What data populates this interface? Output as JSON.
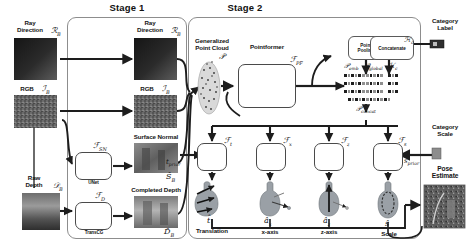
{
  "figure": {
    "stages": [
      {
        "id": "stage1",
        "label": "Stage 1"
      },
      {
        "id": "stage2",
        "label": "Stage 2"
      }
    ]
  },
  "stage1": {
    "inputs": [
      {
        "name": "ray-direction-input",
        "label_line1": "Ray",
        "label_line2": "Direction",
        "symbol": "ℛ",
        "sub": "B",
        "thumb": "ray-direction-map"
      },
      {
        "name": "rgb-input",
        "label_line1": "RGB",
        "label_line2": "",
        "symbol": "ℐ",
        "sub": "B",
        "thumb": "rgb-image"
      },
      {
        "name": "raw-depth-input",
        "label_line1": "Raw",
        "label_line2": "Depth",
        "symbol": "𝒟",
        "sub": "B",
        "thumb": "raw-depth-map"
      }
    ],
    "modules": [
      {
        "name": "unet-module",
        "operator": "ℱ",
        "operator_sub": "SN",
        "caption": "UNet"
      },
      {
        "name": "transcg-module",
        "operator": "ℱ",
        "operator_sub": "D",
        "caption": "TransCG"
      }
    ],
    "outputs": [
      {
        "name": "ray-direction-output",
        "label_line1": "Ray",
        "label_line2": "Direction",
        "symbol": "ℛ",
        "sub": "B",
        "thumb": "ray-direction-map"
      },
      {
        "name": "rgb-output",
        "label_line1": "RGB",
        "label_line2": "",
        "symbol": "ℐ",
        "sub": "B",
        "thumb": "rgb-image"
      },
      {
        "name": "surface-normal-output",
        "label_line1": "Surface Normal",
        "label_line2": "",
        "symbol": "Ŝ",
        "sub": "B",
        "thumb": "surface-normal-map"
      },
      {
        "name": "completed-depth-output",
        "label_line1": "Completed Depth",
        "label_line2": "",
        "symbol": "D̂",
        "sub": "B",
        "thumb": "completed-depth-map"
      }
    ]
  },
  "stage2": {
    "point_cloud": {
      "label_line1": "Generalized",
      "label_line2": "Point Cloud",
      "symbol": "𝒫"
    },
    "pointformer": {
      "label": "Pointformer",
      "operator": "ℱ",
      "operator_sub": "PF"
    },
    "point_pooling": {
      "label_line1": "Point",
      "label_line2": "Pooling"
    },
    "concatenate": {
      "label": "Concatenate"
    },
    "category_label": {
      "label_line1": "Category",
      "label_line2": "Label",
      "symbol": "ℋ",
      "sub": "c",
      "thumb": "category-label-swatch"
    },
    "category_scale": {
      "label_line1": "Category",
      "label_line2": "Scale",
      "symbol": "s",
      "sub": "prior",
      "thumb": "category-scale-swatch"
    },
    "features": [
      {
        "name": "p-emb-features",
        "symbol": "𝒫",
        "sub": "emb"
      },
      {
        "name": "p-global-features",
        "symbol": "𝒫",
        "sub": "global"
      },
      {
        "name": "h-c-features",
        "symbol": "ℋ",
        "sub": "c"
      }
    ],
    "concat_feature": {
      "name": "p-concat-features",
      "symbol": "𝒫",
      "sub": "concat"
    },
    "t_prior": {
      "symbol": "t",
      "sub": "prior"
    },
    "decoders": [
      {
        "name": "translation-decoder",
        "operator": "ℱ",
        "operator_sub": "t",
        "out_symbol": "t̂",
        "out_label_line1": "Translation",
        "out_label_line2": ""
      },
      {
        "name": "x-axis-decoder",
        "operator": "ℱ",
        "operator_sub": "x",
        "out_symbol": "â",
        "out_sub": "x",
        "out_label_line1": "x-axis",
        "out_label_line2": ""
      },
      {
        "name": "z-axis-decoder",
        "operator": "ℱ",
        "operator_sub": "z",
        "out_symbol": "â",
        "out_sub": "z",
        "out_label_line1": "z-axis",
        "out_label_line2": ""
      },
      {
        "name": "scale-decoder",
        "operator": "ℱ",
        "operator_sub": "s",
        "out_symbol": "ŝ",
        "out_label_line1": "Scale",
        "out_label_line2": ""
      }
    ],
    "pose_estimate": {
      "label_line1": "Pose",
      "label_line2": "Estimate",
      "thumb": "pose-estimate-render"
    }
  },
  "colors": {
    "ink": "#141414",
    "line": "#2b2b2b",
    "box_border": "#5a5a5a",
    "stage_border": "#8d8d8d",
    "object_fill": "#9aa0a6",
    "background": "#ffffff"
  }
}
